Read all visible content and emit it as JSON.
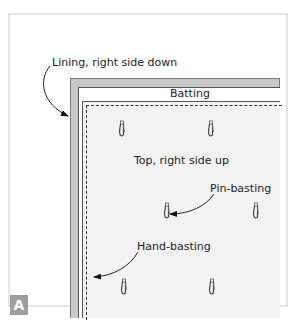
{
  "figure": {
    "panel_badge": "A",
    "layers": {
      "lining": "Lining, right side down",
      "batting": "Batting",
      "top": "Top, right side up"
    },
    "callouts": {
      "pin_basting": "Pin-basting",
      "hand_basting": "Hand-basting"
    },
    "icons": [
      "safety-pin-icon",
      "arrow-icon"
    ],
    "colors": {
      "lining": "#c8c8c8",
      "batting": "#ffffff",
      "top": "#f2f2f2",
      "badge": "#9e9e9e",
      "basting_stitch": "#333333"
    },
    "pin_count": 6
  }
}
